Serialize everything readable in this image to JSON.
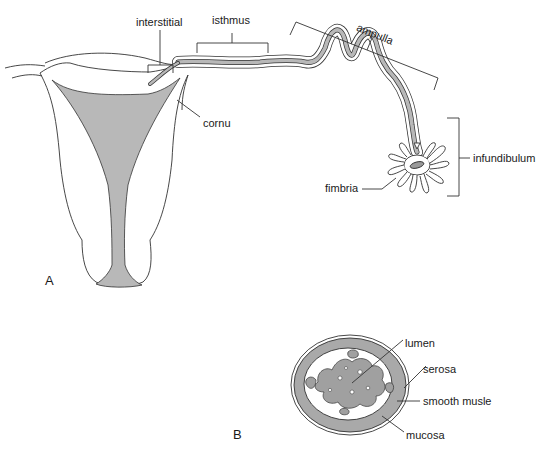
{
  "diagram": {
    "panel_a": {
      "panel_label": "A",
      "labels": {
        "interstitial": "interstitial",
        "isthmus": "isthmus",
        "ampulla": "ampulla",
        "cornu": "cornu",
        "fimbria": "fimbria",
        "infundibulum": "infundibulum"
      }
    },
    "panel_b": {
      "panel_label": "B",
      "labels": {
        "lumen": "lumen",
        "serosa": "serosa",
        "smooth_muscle": "smooth musle",
        "mucosa": "mucosa"
      }
    },
    "colors": {
      "line": "#333333",
      "fill_shade": "#b8b8b8",
      "background": "#ffffff"
    }
  }
}
